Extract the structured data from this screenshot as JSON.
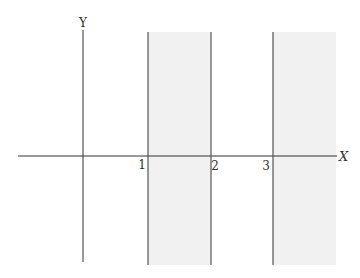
{
  "diagram": {
    "axes": {
      "x_label": "X",
      "y_label": "Y"
    },
    "tick_labels": [
      "1",
      "2",
      "3"
    ],
    "vertical_lines_at": [
      1,
      2,
      3
    ],
    "shaded_regions": [
      {
        "from": 1,
        "to": 2,
        "description": "strip between x=1 and x=2"
      },
      {
        "from": 3,
        "to": null,
        "description": "region to the right of x=3"
      }
    ],
    "colors": {
      "axis": "#333333",
      "line": "#555555",
      "shade": "#f1f1f1",
      "background": "#ffffff"
    }
  }
}
